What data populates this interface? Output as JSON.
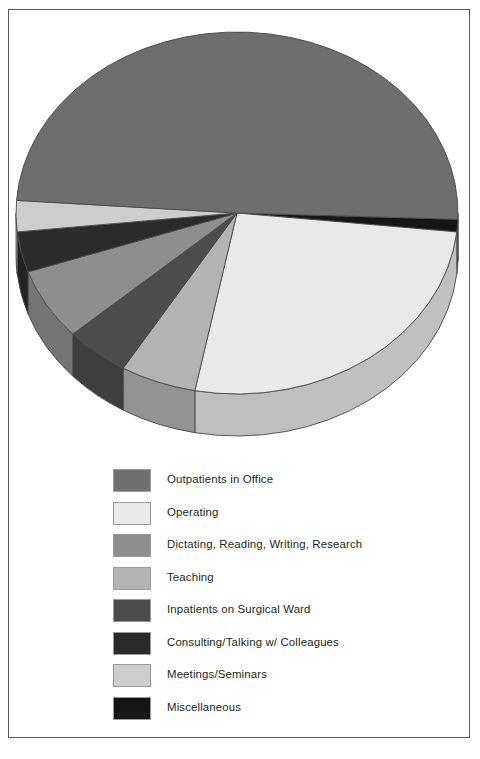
{
  "figure": {
    "background_color": "#ffffff",
    "frame_color": "#58595b"
  },
  "chart_data": {
    "type": "pie",
    "title": "",
    "subtitle": "",
    "xlabel": "",
    "ylabel": "",
    "three_d": true,
    "legend_position": "bottom",
    "grid": false,
    "categories": [
      "Outpatients in Office",
      "Operating",
      "Dictating, Reading, Writing, Research",
      "Teaching",
      "Inpatients on Surgical Ward",
      "Consulting/Talking w/ Colleagues",
      "Meetings/Seminars",
      "Miscellaneous"
    ],
    "values": [
      49.5,
      26.5,
      6.5,
      5.5,
      4.5,
      3.5,
      2.5,
      1.5
    ],
    "colors": [
      "#6e6e6e",
      "#e9e9e9",
      "#8e8e8e",
      "#b3b3b3",
      "#4c4c4c",
      "#2b2b2b",
      "#cdcdcd",
      "#161616"
    ],
    "slice_angles_deg": [
      {
        "name": "Miscellaneous",
        "start": 2,
        "end": 6
      },
      {
        "name": "Operating",
        "start": 6,
        "end": 101
      },
      {
        "name": "Teaching",
        "start": 101,
        "end": 121
      },
      {
        "name": "Inpatients on Surgical Ward",
        "start": 121,
        "end": 138
      },
      {
        "name": "Dictating, Reading, Writing, Research",
        "start": 138,
        "end": 161
      },
      {
        "name": "Consulting/Talking w/ Colleagues",
        "start": 161,
        "end": 174
      },
      {
        "name": "Meetings/Seminars",
        "start": 174,
        "end": 184
      },
      {
        "name": "Outpatients in Office",
        "start": 184,
        "end": 362
      }
    ],
    "geometry": {
      "center_x": 228,
      "center_y": 203,
      "radius_x": 221,
      "radius_y": 181,
      "depth": 42
    }
  },
  "legend": {
    "items": [
      {
        "label": "Outpatients in Office",
        "color": "#6e6e6e"
      },
      {
        "label": "Operating",
        "color": "#e9e9e9"
      },
      {
        "label": "Dictating, Reading, Writing, Research",
        "color": "#8e8e8e"
      },
      {
        "label": "Teaching",
        "color": "#b3b3b3"
      },
      {
        "label": "Inpatients on Surgical Ward",
        "color": "#4c4c4c"
      },
      {
        "label": "Consulting/Talking w/ Colleagues",
        "color": "#2b2b2b"
      },
      {
        "label": "Meetings/Seminars",
        "color": "#cdcdcd"
      },
      {
        "label": "Miscellaneous",
        "color": "#161616"
      }
    ]
  }
}
